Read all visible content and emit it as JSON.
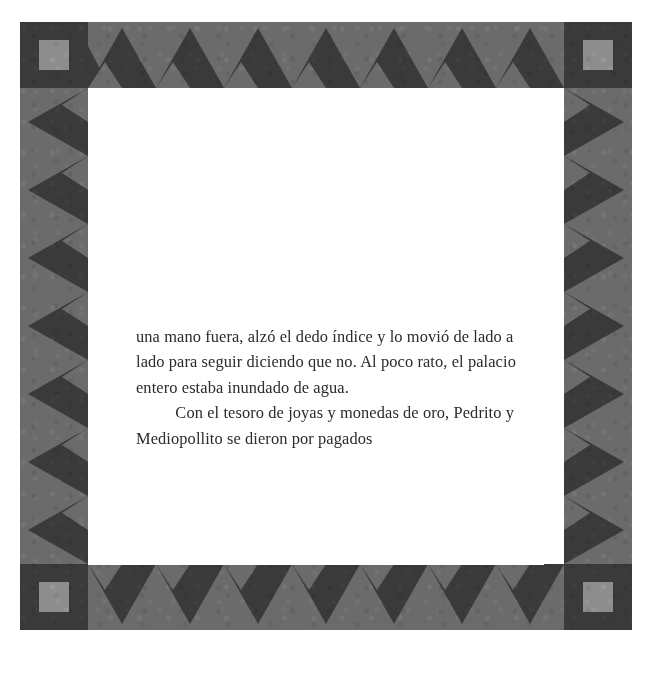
{
  "page": {
    "background_color": "#ffffff",
    "frame": {
      "band_color": "#6b6b6b",
      "motif_color": "#3a3a3a",
      "corner_color": "#3a3a3a",
      "corner_inner_color": "#8d8d8d",
      "corner_label": "corner-block",
      "motif_name": "zigzag-triangle-band",
      "corners": [
        {
          "name": "top-left"
        },
        {
          "name": "top-right"
        },
        {
          "name": "bottom-left"
        },
        {
          "name": "bottom-right"
        }
      ],
      "edges": [
        {
          "name": "top",
          "motif": "triangles-pointing-up",
          "count": 7
        },
        {
          "name": "bottom",
          "motif": "triangles-pointing-down",
          "count": 7
        },
        {
          "name": "left",
          "motif": "triangles-pointing-left",
          "count": 7
        },
        {
          "name": "right",
          "motif": "triangles-pointing-right",
          "count": 7
        }
      ]
    },
    "text": {
      "color": "#2b2b2b",
      "paragraphs": [
        "una mano fuera, alzó el dedo índice y lo movió de lado a lado para seguir diciendo que no. Al poco rato, el palacio entero estaba inundado de agua.",
        "Con el tesoro de joyas y monedas de oro, Pedrito y  Mediopollito se dieron por pagados"
      ]
    }
  }
}
